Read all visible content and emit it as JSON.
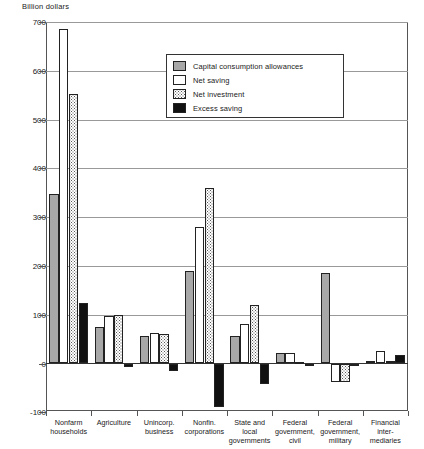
{
  "chart_data": {
    "type": "bar",
    "title": "",
    "subtitle": "",
    "xlabel": "",
    "ylabel": "Billion dollars",
    "ylim": [
      -100,
      700
    ],
    "yticks": [
      -100,
      0,
      100,
      200,
      300,
      400,
      500,
      600,
      700
    ],
    "ytick_labels": [
      "-100",
      "0",
      "100",
      "200",
      "300",
      "400",
      "500",
      "600",
      "700"
    ],
    "grid": true,
    "grid_axis": "y",
    "legend_position": "upper-center",
    "categories": [
      "Nonfarm\nhouseholds",
      "Agriculture",
      "Unincorp.\nbusiness",
      "Nonfin.\ncorporations",
      "State and\nlocal\ngovernments",
      "Federal\ngovernment,\ncivil",
      "Federal\ngovernment,\nmilitary",
      "Financial\ninter-\nmediaries"
    ],
    "series": [
      {
        "name": "Capital consumption allowances",
        "color": "#a8a8a8",
        "pattern": "solid-gray",
        "values": [
          347,
          75,
          57,
          190,
          57,
          22,
          185,
          5
        ]
      },
      {
        "name": "Net saving",
        "color": "#ffffff",
        "pattern": "white",
        "values": [
          685,
          97,
          63,
          280,
          80,
          22,
          -38,
          25
        ]
      },
      {
        "name": "Net investment",
        "color": "#ffffff",
        "pattern": "dotted",
        "values": [
          553,
          100,
          60,
          360,
          120,
          3,
          -38,
          5
        ]
      },
      {
        "name": "Excess saving",
        "color": "#111111",
        "pattern": "black",
        "values": [
          125,
          -8,
          -15,
          -90,
          -43,
          -5,
          0,
          18
        ]
      }
    ]
  },
  "legend": {
    "items": [
      {
        "label": "Capital consumption allowances",
        "swatch": "solid-gray"
      },
      {
        "label": "Net saving",
        "swatch": "white"
      },
      {
        "label": "Net investment",
        "swatch": "dotted"
      },
      {
        "label": "Excess saving",
        "swatch": "black"
      }
    ]
  },
  "axis": {
    "unit_label": "Billion dollars"
  }
}
